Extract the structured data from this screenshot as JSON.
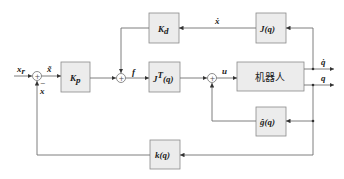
{
  "diagram": {
    "type": "block-diagram",
    "title": "",
    "blocks": {
      "kp": {
        "label": "K",
        "sub": "p"
      },
      "kd": {
        "label": "K",
        "sub": "d"
      },
      "jt": {
        "label": "J",
        "sup": "T",
        "arg": "(q)"
      },
      "j": {
        "label": "J(q)"
      },
      "robot": {
        "label": "机器人"
      },
      "g": {
        "label": "ĝ(q)"
      },
      "k": {
        "label": "k(q)"
      }
    },
    "signals": {
      "xr": {
        "label": "x",
        "sub": "r"
      },
      "x_err": {
        "label": "x̃"
      },
      "x_fb": {
        "label": "x"
      },
      "minus": "−",
      "f": {
        "label": "f"
      },
      "u": {
        "label": "u"
      },
      "xdot": {
        "label": "ẋ"
      },
      "qdot": {
        "label": "q̇"
      },
      "q": {
        "label": "q"
      }
    },
    "junction_symbol": "+",
    "colors": {
      "block_fill": "#ececec",
      "block_stroke": "#8a8a8a",
      "line": "#707070",
      "text": "#222222"
    }
  }
}
